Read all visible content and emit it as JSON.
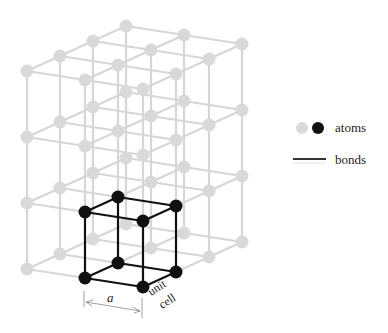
{
  "figure": {
    "lattice": {
      "origin": [
        27,
        71
      ],
      "width_vector": [
        58,
        9
      ],
      "depth_vector": [
        33,
        -15
      ],
      "height_vector": [
        0,
        66
      ],
      "counts": {
        "width": 3,
        "depth": 4,
        "height": 4
      },
      "atom_radius": 6.5,
      "atom_color": "#d9d9d9",
      "bond_color": "#d6d6d6"
    },
    "unit_cell": {
      "i_range": [
        1,
        2
      ],
      "j_range": [
        0,
        1
      ],
      "k_range": [
        2,
        3
      ],
      "atom_color": "#111111",
      "bond_color": "#111111",
      "label_line1": "unit",
      "label_line2": "cell"
    },
    "dimension": {
      "label": "a"
    }
  },
  "legend": {
    "atoms_label": "atoms",
    "bonds_label": "bonds",
    "gray_atom_color": "#d9d9d9",
    "black_atom_color": "#111111",
    "bond_color": "#222222"
  }
}
